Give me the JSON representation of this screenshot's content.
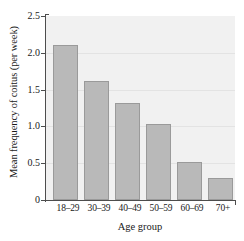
{
  "chart_data": {
    "type": "bar",
    "title": "",
    "categories": [
      "18–29",
      "30–39",
      "40–49",
      "50–59",
      "60–69",
      "70+"
    ],
    "values": [
      2.11,
      1.62,
      1.32,
      1.03,
      0.52,
      0.3
    ],
    "series": [
      {
        "name": "Mean frequency of coitus (per week)",
        "values": [
          2.11,
          1.62,
          1.32,
          1.03,
          0.52,
          0.3
        ]
      }
    ],
    "xlabel": "Age group",
    "ylabel": "Mean frequency of coitus (per week)",
    "ylim": [
      0,
      2.5
    ],
    "yticks": [
      "0",
      "0.5",
      "1.0",
      "1.5",
      "2.0",
      "2.5"
    ],
    "ytick_values": [
      0,
      0.5,
      1.0,
      1.5,
      2.0,
      2.5
    ],
    "grid": true,
    "legend": "none",
    "colors": {
      "bar_fill": "#b9b9b9",
      "bar_edge": "#9a9a9a",
      "plot_background": "#f1f1f1",
      "gridline": "#e3e3e3",
      "axis": "#4d4d4d",
      "text": "#1a1a1a",
      "figure_background": "#ffffff"
    }
  }
}
